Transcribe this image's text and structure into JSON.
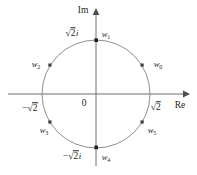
{
  "figure": {
    "type": "complex-plane-diagram",
    "background_color": "#ffffff",
    "stroke_color": "#6d6e71",
    "text_color": "#231f20",
    "width": 197,
    "height": 175
  },
  "axes": {
    "imaginary_label": "Im",
    "real_label": "Re",
    "origin_label": "0",
    "center": {
      "x": 96,
      "y": 94
    },
    "real_axis": {
      "x1": 8,
      "y1": 94,
      "x2": 186,
      "y2": 94
    },
    "imaginary_axis": {
      "x1": 96,
      "y1": 166,
      "x2": 96,
      "y2": 12
    }
  },
  "circle": {
    "label": "|z| = sqrt(2)",
    "radius_px": 54,
    "radius_value": "√2"
  },
  "ticks": [
    {
      "name": "tick-positive-imaginary",
      "text_prefix": "",
      "radicand": "2",
      "suffix": "i",
      "x": 72,
      "y": 34
    },
    {
      "name": "tick-negative-imaginary",
      "text_prefix": "−",
      "radicand": "2",
      "suffix": "i",
      "x": 72,
      "y": 157
    },
    {
      "name": "tick-positive-real",
      "text_prefix": "",
      "radicand": "2",
      "suffix": "",
      "x": 155,
      "y": 108
    },
    {
      "name": "tick-negative-real",
      "text_prefix": "−",
      "radicand": "2",
      "suffix": "",
      "x": 30,
      "y": 109
    }
  ],
  "roots": [
    {
      "id": "w0",
      "label": "w",
      "sub": "0",
      "angle_deg": 30,
      "point_x": 143,
      "point_y": 66,
      "label_x": 158,
      "label_y": 64
    },
    {
      "id": "w1",
      "label": "w",
      "sub": "1",
      "angle_deg": 90,
      "point_x": 96,
      "point_y": 40,
      "label_x": 106,
      "label_y": 34
    },
    {
      "id": "w2",
      "label": "w",
      "sub": "2",
      "angle_deg": 150,
      "point_x": 50,
      "point_y": 66,
      "label_x": 36,
      "label_y": 64
    },
    {
      "id": "w3",
      "label": "w",
      "sub": "3",
      "angle_deg": 210,
      "point_x": 50,
      "point_y": 122,
      "label_x": 44,
      "label_y": 130
    },
    {
      "id": "w4",
      "label": "w",
      "sub": "4",
      "angle_deg": 270,
      "point_x": 96,
      "point_y": 148,
      "label_x": 106,
      "label_y": 157
    },
    {
      "id": "w5",
      "label": "w",
      "sub": "5",
      "angle_deg": 330,
      "point_x": 143,
      "point_y": 122,
      "label_x": 152,
      "label_y": 130
    }
  ]
}
